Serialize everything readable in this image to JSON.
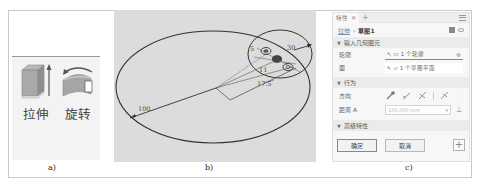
{
  "captions": {
    "a": "a)",
    "b": "b)",
    "c": "c)"
  },
  "panel_a": {
    "tools": [
      {
        "label": "拉伸",
        "icon": "extrude-icon"
      },
      {
        "label": "旋转",
        "icon": "revolve-icon"
      }
    ]
  },
  "panel_b": {
    "dimensions": {
      "d1": "5",
      "d2": "30",
      "d3": "11",
      "d4": "17.5",
      "d5": "100"
    }
  },
  "panel_c": {
    "tab_label": "特性",
    "tab_close": "✕",
    "tab_add": "+",
    "breadcrumb": {
      "parent": "拉伸",
      "separator": "›",
      "current": "草图1"
    },
    "sections": {
      "input_geometry": "输入几何图元",
      "behavior": "行为",
      "advanced": "高级特性"
    },
    "rows": {
      "profile": {
        "label": "轮廓",
        "value": "1 个轮廓"
      },
      "face": {
        "label": "面",
        "value": "1 个草图平面"
      },
      "direction": {
        "label": "方向"
      },
      "distance": {
        "label": "距离 A",
        "value": "100.000 mm"
      }
    },
    "buttons": {
      "ok": "确定",
      "cancel": "取消",
      "add": "+"
    }
  }
}
